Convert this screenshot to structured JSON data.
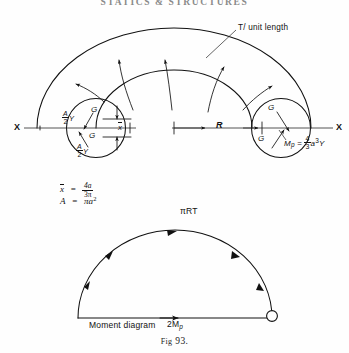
{
  "page": {
    "running_head": "STATICS & STRUCTURES",
    "caption_prefix": "Fig",
    "caption_number": "93.",
    "width": 349,
    "height": 353,
    "ink_color": "#111111",
    "background_color": "#ffffff"
  },
  "main_diagram": {
    "name": "curved-bar-torque-diagram",
    "axis_label_left": "X",
    "axis_label_right": "X",
    "radius_label": "R",
    "traction_note": "T/ unit length",
    "arrow_count": 5
  },
  "left_section": {
    "name": "left-cross-section",
    "upper_force_label": "G",
    "lower_force_label": "G",
    "upper_stress_num": "A",
    "upper_stress_den": "2",
    "upper_stress_suffix": "Y",
    "lower_stress_num": "A",
    "lower_stress_den": "2",
    "lower_stress_suffix": "Y",
    "centroid_label": "x",
    "centroid_overbar": true
  },
  "right_section": {
    "name": "right-cross-section",
    "upper_force_label": "G",
    "lower_force_label": "G",
    "moment_symbol": "M",
    "moment_subscript": "p",
    "moment_equals": "=",
    "moment_coeff_num": "4",
    "moment_coeff_den": "3",
    "moment_term": "a",
    "moment_exponent": "3",
    "moment_yield": "Y"
  },
  "equations": [
    {
      "name": "centroid-equation",
      "lhs": "x",
      "lhs_overbar": true,
      "equals": "=",
      "num": "4a",
      "den": "3π"
    },
    {
      "name": "area-equation",
      "lhs": "A",
      "lhs_overbar": false,
      "equals": "=",
      "rhs": "πa",
      "rhs_exponent": "2"
    }
  ],
  "moment_diagram": {
    "name": "moment-diagram",
    "title": "Moment diagram",
    "apex_label": "πRT",
    "base_symbol": "2M",
    "base_subscript": "p",
    "arrow_count_arc": 5,
    "has_hinge_node": true
  }
}
